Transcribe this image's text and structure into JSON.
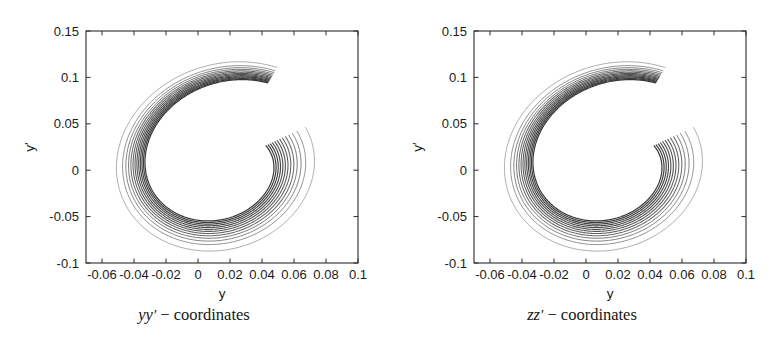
{
  "figure": {
    "background": "#ffffff",
    "ink_color": "#2b2b2b"
  },
  "panels": [
    {
      "id": "left",
      "caption_symbol": "yy",
      "caption_prime": "′",
      "caption_dash": "−",
      "caption_word": "coordinates",
      "xlabel": "y",
      "ylabel": "y′"
    },
    {
      "id": "right",
      "caption_symbol": "zz",
      "caption_prime": "′",
      "caption_dash": "−",
      "caption_word": "coordinates",
      "xlabel": "y",
      "ylabel": "y′"
    }
  ],
  "chart_data": [
    {
      "type": "line",
      "title": "yy ′ − coordinates",
      "xlabel": "y",
      "ylabel": "y′",
      "xlim": [
        -0.07,
        0.1
      ],
      "ylim": [
        -0.1,
        0.15
      ],
      "xticks": [
        -0.06,
        -0.04,
        -0.02,
        0,
        0.02,
        0.04,
        0.06,
        0.08,
        0.1
      ],
      "xtick_labels": [
        "-0.06",
        "-0.04",
        "-0.02",
        "0",
        "0.02",
        "0.04",
        "0.06",
        "0.08",
        "0.1"
      ],
      "yticks": [
        -0.1,
        -0.05,
        0,
        0.05,
        0.1,
        0.15
      ],
      "ytick_labels": [
        "-0.1",
        "-0.05",
        "0",
        "0.05",
        "0.1",
        "0.15"
      ],
      "grid": false,
      "legend": false,
      "description": "Dense bundle of nested phase-space trajectories forming a spiral / C-shaped band, open toward upper-left, with one cut end near (0.005, 0.115) and another near (-0.007, 0.045).",
      "n_turns": 13,
      "spiral": {
        "center": [
          0.016,
          0.007
        ],
        "theta_start_deg": 72,
        "theta_sweep_deg": 320,
        "outer_rx_start": 0.073,
        "outer_rx_end": 0.055,
        "outer_ry_start": 0.112,
        "outer_ry_end": 0.084,
        "inner_rx_start": 0.06,
        "inner_rx_end": 0.0285,
        "inner_ry_start": 0.094,
        "inner_ry_end": 0.042,
        "tilt_deg": -6
      },
      "extent": {
        "x_min": -0.057,
        "x_max": 0.089,
        "y_min": -0.08,
        "y_max": 0.119
      }
    },
    {
      "type": "line",
      "title": "zz ′ − coordinates",
      "xlabel": "y",
      "ylabel": "y′",
      "xlim": [
        -0.07,
        0.1
      ],
      "ylim": [
        -0.1,
        0.15
      ],
      "xticks": [
        -0.06,
        -0.04,
        -0.02,
        0,
        0.02,
        0.04,
        0.06,
        0.08,
        0.1
      ],
      "xtick_labels": [
        "-0.06",
        "-0.04",
        "-0.02",
        "0",
        "0.02",
        "0.04",
        "0.06",
        "0.08",
        "0.1"
      ],
      "yticks": [
        -0.1,
        -0.05,
        0,
        0.05,
        0.1,
        0.15
      ],
      "ytick_labels": [
        "-0.1",
        "-0.05",
        "0",
        "0.05",
        "0.1",
        "0.15"
      ],
      "grid": false,
      "legend": false,
      "description": "Dense bundle of nested phase-space trajectories forming a spiral / C-shaped band, visually near-identical to the yy' panel.",
      "n_turns": 13,
      "spiral": {
        "center": [
          0.016,
          0.007
        ],
        "theta_start_deg": 72,
        "theta_sweep_deg": 320,
        "outer_rx_start": 0.073,
        "outer_rx_end": 0.055,
        "outer_ry_start": 0.112,
        "outer_ry_end": 0.084,
        "inner_rx_start": 0.06,
        "inner_rx_end": 0.0285,
        "inner_ry_start": 0.094,
        "inner_ry_end": 0.042,
        "tilt_deg": -6
      },
      "extent": {
        "x_min": -0.057,
        "x_max": 0.089,
        "y_min": -0.08,
        "y_max": 0.119
      }
    }
  ]
}
